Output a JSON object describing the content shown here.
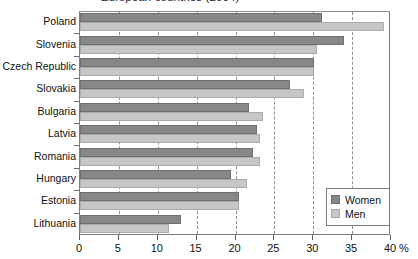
{
  "chart_data": {
    "type": "bar",
    "orientation": "horizontal",
    "title": "European countries (2004)",
    "xlabel": "%",
    "ylabel": "",
    "xlim": [
      0,
      40
    ],
    "xticks": [
      0,
      5,
      10,
      15,
      20,
      25,
      30,
      35,
      40
    ],
    "xticklabels": [
      "0",
      "5",
      "10",
      "15",
      "20",
      "25",
      "30",
      "35",
      "40"
    ],
    "grid": "vertical-dashed",
    "legend_position": "bottom-right",
    "categories": [
      "Poland",
      "Slovenia",
      "Czech Republic",
      "Slovakia",
      "Bulgaria",
      "Latvia",
      "Romania",
      "Hungary",
      "Estonia",
      "Lithuania"
    ],
    "series": [
      {
        "name": "Women",
        "color": "#878787",
        "values": [
          31.1,
          33.9,
          30.1,
          27.0,
          21.8,
          22.8,
          22.3,
          19.4,
          20.5,
          13.0
        ]
      },
      {
        "name": "Men",
        "color": "#c6c6c6",
        "values": [
          39.1,
          30.5,
          30.1,
          28.8,
          23.6,
          23.2,
          23.1,
          21.5,
          20.4,
          11.4
        ]
      }
    ]
  },
  "legend": {
    "items": [
      {
        "label": "Women",
        "swatch": "women"
      },
      {
        "label": "Men",
        "swatch": "men"
      }
    ]
  }
}
